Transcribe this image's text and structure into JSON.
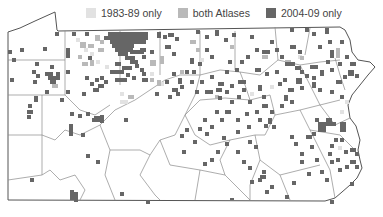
{
  "map": {
    "region": "Pennsylvania",
    "legend": [
      {
        "label": "1983-89 only",
        "color": "#e2e2e2"
      },
      {
        "label": "both Atlases",
        "color": "#b9b9b9"
      },
      {
        "label": "2004-09 only",
        "color": "#666666"
      }
    ],
    "colors": {
      "outline": "#555555",
      "county_line": "#8a8a8a",
      "background": "#ffffff"
    }
  }
}
